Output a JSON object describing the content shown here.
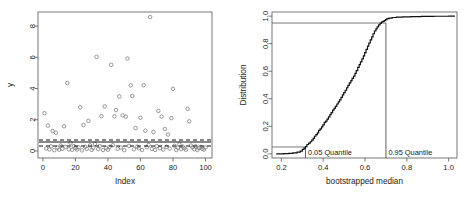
{
  "chart_data": [
    {
      "id": "scatter-residuals",
      "type": "scatter",
      "title": "",
      "xlabel": "Index",
      "ylabel": "y",
      "xlim": [
        -3,
        104
      ],
      "ylim": [
        -0.45,
        8.9
      ],
      "xticks": [
        0,
        20,
        40,
        60,
        80,
        100
      ],
      "yticks": [
        0,
        2,
        4,
        6,
        8
      ],
      "grid": false,
      "legend": "none",
      "point_style": "open-circle",
      "x": [
        1,
        2,
        3,
        4,
        5,
        6,
        7,
        8,
        9,
        10,
        11,
        12,
        13,
        14,
        15,
        16,
        17,
        18,
        19,
        20,
        21,
        22,
        23,
        24,
        25,
        26,
        27,
        28,
        29,
        30,
        31,
        32,
        33,
        34,
        35,
        36,
        37,
        38,
        39,
        40,
        41,
        42,
        43,
        44,
        45,
        46,
        47,
        48,
        49,
        50,
        51,
        52,
        53,
        54,
        55,
        56,
        57,
        58,
        59,
        60,
        61,
        62,
        63,
        64,
        65,
        66,
        67,
        68,
        69,
        70,
        71,
        72,
        73,
        74,
        75,
        76,
        77,
        78,
        79,
        80,
        81,
        82,
        83,
        84,
        85,
        86,
        87,
        88,
        89,
        90,
        91,
        92,
        93,
        94,
        95,
        96,
        97,
        98,
        99,
        100
      ],
      "y": [
        2.42,
        0.16,
        1.62,
        0.1,
        0.3,
        1.28,
        0.05,
        1.17,
        0.22,
        0.08,
        0.35,
        0.14,
        1.58,
        0.26,
        4.35,
        0.11,
        0.52,
        0.07,
        0.31,
        0.18,
        0.09,
        0.23,
        2.8,
        0.04,
        1.66,
        0.27,
        0.13,
        1.93,
        0.36,
        0.07,
        0.21,
        0.45,
        6.03,
        0.12,
        0.31,
        2.23,
        0.06,
        2.85,
        0.19,
        0.08,
        0.26,
        5.52,
        0.37,
        2.22,
        2.62,
        0.14,
        3.49,
        0.22,
        2.28,
        0.05,
        2.2,
        5.92,
        0.33,
        4.2,
        3.52,
        0.11,
        1.47,
        0.28,
        0.17,
        2.13,
        0.06,
        4.21,
        1.3,
        0.24,
        0.39,
        8.58,
        0.13,
        1.22,
        0.07,
        0.31,
        2.57,
        0.18,
        2.2,
        0.09,
        1.4,
        0.26,
        1.05,
        0.15,
        2.1,
        3.98,
        0.33,
        0.06,
        0.21,
        0.42,
        0.12,
        0.28,
        0.17,
        0.08,
        2.7,
        1.9,
        0.35,
        0.23,
        0.11,
        0.3,
        0.06,
        0.19,
        0.26,
        0.14,
        0.09,
        0.22
      ],
      "reference_lines": [
        {
          "label": "0.95 quantile of bootstrapped medians",
          "value": 0.7,
          "style": "dashed"
        },
        {
          "label": "sample median",
          "value": 0.57,
          "style": "solid"
        },
        {
          "label": "0.05 quantile of bootstrapped medians",
          "value": 0.32,
          "style": "dashed"
        }
      ]
    },
    {
      "id": "bootstrap-ecdf",
      "type": "line",
      "title": "",
      "xlabel": "bootstrapped median",
      "ylabel": "Distribution",
      "xlim": [
        0.155,
        1.04
      ],
      "ylim": [
        -0.03,
        1.03
      ],
      "xticks": [
        0.2,
        0.4,
        0.6,
        0.8,
        1.0
      ],
      "yticks": [
        0.0,
        0.2,
        0.4,
        0.6,
        0.8,
        1.0
      ],
      "grid": false,
      "legend": "none",
      "series": [
        {
          "name": "empirical CDF of bootstrapped median",
          "x": [
            0.175,
            0.21,
            0.235,
            0.255,
            0.275,
            0.29,
            0.3,
            0.308,
            0.315,
            0.322,
            0.33,
            0.338,
            0.345,
            0.352,
            0.358,
            0.365,
            0.372,
            0.378,
            0.385,
            0.392,
            0.398,
            0.405,
            0.412,
            0.418,
            0.425,
            0.432,
            0.438,
            0.445,
            0.452,
            0.458,
            0.465,
            0.472,
            0.478,
            0.485,
            0.492,
            0.498,
            0.505,
            0.512,
            0.518,
            0.525,
            0.532,
            0.538,
            0.545,
            0.552,
            0.558,
            0.565,
            0.572,
            0.578,
            0.585,
            0.592,
            0.598,
            0.605,
            0.612,
            0.618,
            0.625,
            0.632,
            0.638,
            0.645,
            0.652,
            0.658,
            0.665,
            0.672,
            0.678,
            0.685,
            0.692,
            0.698,
            0.705,
            0.715,
            0.73,
            0.75,
            0.78,
            0.82,
            0.87,
            0.93,
            1.0,
            1.03
          ],
          "y": [
            0.0,
            0.002,
            0.004,
            0.007,
            0.012,
            0.02,
            0.032,
            0.042,
            0.052,
            0.068,
            0.078,
            0.088,
            0.1,
            0.112,
            0.128,
            0.14,
            0.152,
            0.17,
            0.182,
            0.196,
            0.21,
            0.228,
            0.238,
            0.252,
            0.268,
            0.285,
            0.3,
            0.318,
            0.33,
            0.345,
            0.362,
            0.378,
            0.392,
            0.41,
            0.428,
            0.445,
            0.462,
            0.48,
            0.498,
            0.515,
            0.532,
            0.548,
            0.565,
            0.585,
            0.605,
            0.628,
            0.648,
            0.668,
            0.69,
            0.712,
            0.735,
            0.758,
            0.782,
            0.805,
            0.828,
            0.85,
            0.872,
            0.892,
            0.908,
            0.922,
            0.936,
            0.948,
            0.956,
            0.962,
            0.968,
            0.975,
            0.982,
            0.986,
            0.99,
            0.993,
            0.995,
            0.997,
            0.998,
            0.999,
            1.0,
            1.0
          ]
        }
      ],
      "annotations": [
        {
          "text": "0.05 Quantile",
          "x": 0.315,
          "y": 0.05
        },
        {
          "text": "0.95 Quantile",
          "x": 0.7,
          "y": 0.95
        }
      ],
      "quantile_markers": [
        {
          "name": "q05",
          "x": 0.315,
          "y": 0.05
        },
        {
          "name": "q95",
          "x": 0.7,
          "y": 0.95
        }
      ]
    }
  ]
}
